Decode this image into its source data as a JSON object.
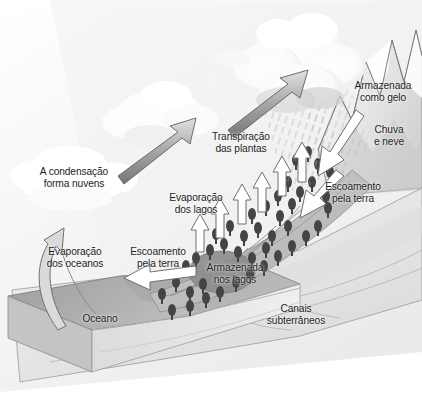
{
  "diagram": {
    "language": "pt-BR",
    "background_color": "#ffffff",
    "text_color": "#1d1d1d",
    "palette": {
      "sky_haze": "#f2f2f2",
      "cloud_white": "#ffffff",
      "cloud_shadow": "#cfcfcf",
      "ocean_top": "#a9a9a9",
      "ocean_front": "#d8d8d8",
      "ground_light": "#e9e9e9",
      "ground_mid": "#d4d4d4",
      "slope_gray": "#c2c2c2",
      "tree_dark": "#4a4a4a",
      "lake_gray": "#8d8d8d",
      "arrow_gray_dark": "#8b8b8b",
      "arrow_gray_light": "#d0d0d0",
      "outline": "#6f6f6f",
      "rain_streak": "#b5b5b5"
    },
    "labels": [
      {
        "id": "condensacao",
        "text": "A condensação\nforma nuvens",
        "x": 22,
        "y": 166,
        "w": 104
      },
      {
        "id": "transpiracao",
        "text": "Transpiração\ndas plantas",
        "x": 196,
        "y": 131,
        "w": 90
      },
      {
        "id": "armazenada-gelo",
        "text": "Armazenada\ncomo gelo",
        "x": 345,
        "y": 80,
        "w": 76
      },
      {
        "id": "chuva-neve",
        "text": "Chuva\ne neve",
        "x": 364,
        "y": 124,
        "w": 50
      },
      {
        "id": "evaporacao-lagos",
        "text": "Evaporação\ndos lagos",
        "x": 157,
        "y": 192,
        "w": 78
      },
      {
        "id": "escoamento-terra-dir",
        "text": "Escoamento\npela terra",
        "x": 313,
        "y": 181,
        "w": 80
      },
      {
        "id": "evaporacao-oceanos",
        "text": "Evaporação\ndos oceanos",
        "x": 32,
        "y": 246,
        "w": 86
      },
      {
        "id": "escoamento-terra-esq",
        "text": "Escoamento\npela terra",
        "x": 118,
        "y": 246,
        "w": 80
      },
      {
        "id": "armazenada-lagos",
        "text": "Armazenada\nnos lagos",
        "x": 196,
        "y": 262,
        "w": 78
      },
      {
        "id": "canais",
        "text": "Canais\nsubterrâneos",
        "x": 256,
        "y": 303,
        "w": 80
      },
      {
        "id": "oceano",
        "text": "Oceano",
        "x": 74,
        "y": 313,
        "w": 52
      }
    ],
    "arrows": {
      "gray_up_left": {
        "name": "condensation-arrow",
        "direction": "up-right"
      },
      "gray_up_right": {
        "name": "transpiration-arrow",
        "direction": "up-right"
      },
      "curved_ocean": {
        "name": "ocean-evaporation-arrow",
        "direction": "curved-up"
      },
      "white_lakes": {
        "name": "lake-evaporation-arrows",
        "direction": "up",
        "count": 5
      },
      "white_runoff_top": {
        "name": "rain-snow-runoff-arrow",
        "direction": "down-left"
      },
      "white_runoff_middle": {
        "name": "land-runoff-arrow-right",
        "direction": "down-left"
      },
      "white_runoff_ocean": {
        "name": "land-runoff-arrow-left",
        "direction": "left"
      }
    },
    "features": {
      "mountains": "snow-capped peaks on the right edge",
      "cloud": "large cumulus mass upper centre-right",
      "rain": "fine diagonal precipitation streaks below cloud",
      "forest": "dark conifers scattered on the slope",
      "lake": "grey ellipse in mid-slope",
      "ocean_slab": "3D block, dark top face, pale front face"
    }
  }
}
